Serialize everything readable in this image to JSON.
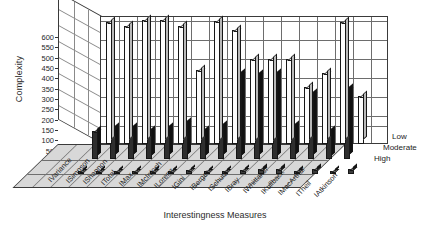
{
  "chart_data": {
    "type": "bar",
    "title": "",
    "xlabel": "Interestingness Measures",
    "ylabel": "Complexity",
    "ylim": [
      0,
      600
    ],
    "yticks": [
      0,
      50,
      100,
      150,
      200,
      250,
      300,
      350,
      400,
      450,
      500,
      550,
      600
    ],
    "grid": true,
    "legend_position": "right",
    "projection": "3d",
    "categories": [
      "IVariance",
      "ISimpson",
      "IShannon",
      "ITotal",
      "IMax",
      "IMcIntosh",
      "ILorenz",
      "IGini",
      "IBerger",
      "ISchutz",
      "IBray",
      "IWhittaker",
      "IKullback",
      "IMacArthur",
      "ITheil",
      "IAtkinson"
    ],
    "series": [
      {
        "name": "Low",
        "values": [
          640,
          620,
          655,
          655,
          620,
          390,
          650,
          600,
          450,
          450,
          450,
          300,
          375,
          640,
          255,
          0
        ]
      },
      {
        "name": "Moderate",
        "values": [
          150,
          165,
          165,
          150,
          165,
          190,
          150,
          175,
          450,
          440,
          450,
          175,
          340,
          150,
          370,
          0
        ]
      },
      {
        "name": "High",
        "values": [
          18,
          18,
          18,
          18,
          18,
          18,
          22,
          18,
          18,
          22,
          24,
          24,
          18,
          24,
          18,
          24
        ]
      }
    ]
  },
  "axes": {
    "ylabel": "Complexity",
    "xlabel": "Interestingness Measures"
  },
  "legend": {
    "items": [
      {
        "label": "Low"
      },
      {
        "label": "Moderate"
      },
      {
        "label": "High"
      }
    ]
  },
  "colors": {
    "low": "#fdfdfd",
    "moderate": "#2e2e2e",
    "high": "#3b3b3b",
    "floor": "#d8d8d8",
    "grid": "#6d6d6d",
    "frame": "#3a3a3a",
    "text": "#1c1c1c"
  }
}
